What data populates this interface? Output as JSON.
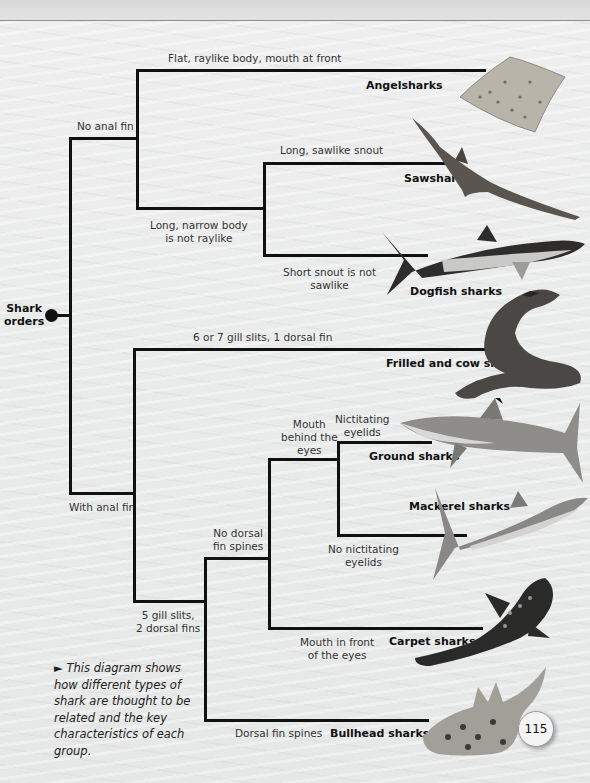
{
  "diagram": {
    "root": {
      "label": "Shark orders"
    },
    "branches": {
      "no_anal_fin": "No anal fin",
      "with_anal_fin": "With anal fin",
      "flat_raylike": "Flat, raylike body, mouth at front",
      "long_narrow": "Long, narrow body is not raylike",
      "long_narrow_l1": "Long, narrow body",
      "long_narrow_l2": "is not raylike",
      "long_sawlike": "Long, sawlike snout",
      "short_snout_l1": "Short snout is not",
      "short_snout_l2": "sawlike",
      "six_seven_gill": "6 or 7 gill slits, 1 dorsal fin",
      "five_gill_l1": "5 gill slits,",
      "five_gill_l2": "2 dorsal fins",
      "no_dorsal_l1": "No dorsal",
      "no_dorsal_l2": "fin spines",
      "mouth_behind_l1": "Mouth",
      "mouth_behind_l2": "behind the",
      "mouth_behind_l3": "eyes",
      "nictitating_l1": "Nictitating",
      "nictitating_l2": "eyelids",
      "no_nictitating_l1": "No nictitating",
      "no_nictitating_l2": "eyelids",
      "mouth_front_l1": "Mouth in front",
      "mouth_front_l2": "of the eyes",
      "dorsal_spines": "Dorsal fin spines"
    },
    "orders": [
      {
        "name": "Angelsharks"
      },
      {
        "name": "Sawsharks"
      },
      {
        "name": "Dogfish sharks"
      },
      {
        "name": "Frilled and cow sharks"
      },
      {
        "name": "Ground sharks"
      },
      {
        "name": "Mackerel sharks"
      },
      {
        "name": "Carpet sharks"
      },
      {
        "name": "Bullhead sharks"
      }
    ]
  },
  "root_label_l1": "Shark",
  "root_label_l2": "orders",
  "caption": {
    "marker": "►",
    "text": "This diagram shows how different types of shark are thought to be related and the key characteristics of each group."
  },
  "page_number": "115"
}
